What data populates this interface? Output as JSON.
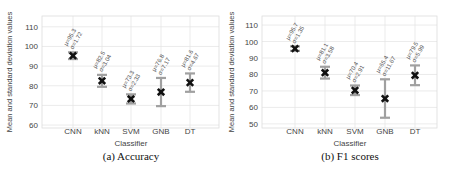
{
  "chart_data": [
    {
      "type": "errorbar",
      "panel": "a",
      "caption": "(a) Accuracy",
      "xlabel": "Classifier",
      "ylabel": "Mean and standard deviation values",
      "categories": [
        "CNN",
        "kNN",
        "SVM",
        "GNB",
        "DT"
      ],
      "series": [
        {
          "name": "Accuracy",
          "mean": [
            95.3,
            82.5,
            73.3,
            76.8,
            81.6
          ],
          "std": [
            1.72,
            3.04,
            2.33,
            7.17,
            4.67
          ]
        }
      ],
      "annotations": [
        [
          "μ=95.3",
          "σ=1.72"
        ],
        [
          "μ=82.5",
          "σ=3.04"
        ],
        [
          "μ=73.3",
          "σ=2.33"
        ],
        [
          "μ=76.8",
          "σ=7.17"
        ],
        [
          "μ=81.6",
          "σ=4.67"
        ]
      ],
      "yticks": [
        60,
        70,
        80,
        90,
        100,
        110
      ],
      "ylim": [
        58.5,
        115.5
      ],
      "grid": true
    },
    {
      "type": "errorbar",
      "panel": "b",
      "caption": "(b) F1 scores",
      "xlabel": "Classifier",
      "ylabel": "Mean and standard deviation values",
      "categories": [
        "CNN",
        "kNN",
        "SVM",
        "GNB",
        "DT"
      ],
      "series": [
        {
          "name": "F1 score",
          "mean": [
            95.7,
            81.1,
            70.4,
            65.4,
            79.5
          ],
          "std": [
            1.35,
            3.58,
            2.91,
            11.67,
            5.99
          ]
        }
      ],
      "annotations": [
        [
          "μ=95.7",
          "σ=1.35"
        ],
        [
          "μ=81.1",
          "σ=3.58"
        ],
        [
          "μ=70.4",
          "σ=2.91"
        ],
        [
          "μ=65.4",
          "σ=11.67"
        ],
        [
          "μ=79.5",
          "σ=5.99"
        ]
      ],
      "yticks": [
        50,
        60,
        70,
        80,
        90,
        100,
        110
      ],
      "ylim": [
        47.5,
        115.5
      ],
      "grid": true
    }
  ],
  "colors": {
    "errorbar": "#a0a0a0",
    "marker": "#111111",
    "grid": "#e6e6e6",
    "axis_text": "#444444",
    "frame": "#dddddd"
  }
}
